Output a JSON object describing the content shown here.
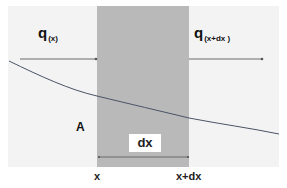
{
  "diagram": {
    "colors": {
      "background": "#f3f3f3",
      "slab": "#b9b9b9",
      "curve": "#4a5466",
      "arrow": "#6b6b6b"
    },
    "flux_in": {
      "symbol": "q",
      "subscript": "(x)"
    },
    "flux_out": {
      "symbol": "q",
      "subscript": "(x+dx )"
    },
    "area_label": "A",
    "width_label": "dx",
    "x_labels": {
      "left": "x",
      "right": "x+dx"
    }
  }
}
